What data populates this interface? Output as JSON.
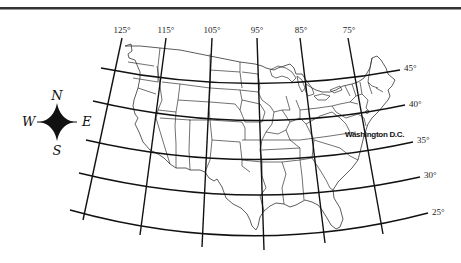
{
  "map": {
    "type": "US map with latitude/longitude grid",
    "meridians": [
      {
        "label": "125°",
        "top": [
          122,
          38
        ],
        "bottom": [
          83,
          220
        ],
        "label_pos": [
          122,
          33
        ]
      },
      {
        "label": "115°",
        "top": [
          166,
          38
        ],
        "bottom": [
          140,
          235
        ],
        "label_pos": [
          166,
          33
        ]
      },
      {
        "label": "105°",
        "top": [
          212,
          38
        ],
        "bottom": [
          202,
          247
        ],
        "label_pos": [
          212,
          33
        ]
      },
      {
        "label": "95°",
        "top": [
          257,
          38
        ],
        "bottom": [
          264,
          250
        ],
        "label_pos": [
          257,
          33
        ]
      },
      {
        "label": "85°",
        "top": [
          300,
          38
        ],
        "bottom": [
          325,
          243
        ],
        "label_pos": [
          301,
          33
        ]
      },
      {
        "label": "75°",
        "top": [
          348,
          38
        ],
        "bottom": [
          383,
          234
        ],
        "label_pos": [
          349,
          33
        ]
      }
    ],
    "parallels": [
      {
        "label": "45°",
        "start": [
          101,
          68
        ],
        "ctrl": [
          250,
          98
        ],
        "end": [
          400,
          70
        ],
        "label_pos": [
          404,
          70
        ]
      },
      {
        "label": "40°",
        "start": [
          93,
          101
        ],
        "ctrl": [
          250,
          138
        ],
        "end": [
          405,
          105
        ],
        "label_pos": [
          409,
          106
        ]
      },
      {
        "label": "35°",
        "start": [
          86,
          140
        ],
        "ctrl": [
          250,
          178
        ],
        "end": [
          413,
          142
        ],
        "label_pos": [
          417,
          142
        ]
      },
      {
        "label": "30°",
        "start": [
          79,
          173
        ],
        "ctrl": [
          250,
          215
        ],
        "end": [
          420,
          177
        ],
        "label_pos": [
          424,
          177
        ]
      },
      {
        "label": "25°",
        "start": [
          70,
          210
        ],
        "ctrl": [
          250,
          260
        ],
        "end": [
          428,
          213
        ],
        "label_pos": [
          432,
          214
        ]
      }
    ],
    "city_label": {
      "text": "Washington D.C.",
      "pos": [
        345,
        137
      ]
    },
    "compass": {
      "center": [
        57,
        122
      ],
      "north": "N",
      "south": "S",
      "east": "E",
      "west": "W"
    }
  }
}
